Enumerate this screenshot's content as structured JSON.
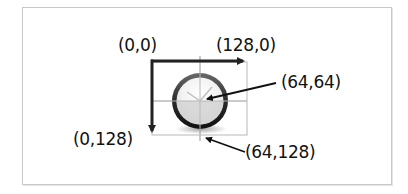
{
  "diagram": {
    "labels": {
      "origin": "(0,0)",
      "top_right": "(128,0)",
      "center": "(64,64)",
      "bottom_left": "(0,128)",
      "bottom_center": "(64,128)"
    },
    "icon": "clock-icon",
    "colors": {
      "frame_border": "#c8c8c8",
      "axis_arrow": "#222222",
      "grid_line": "#b8b8b8",
      "text": "#111111"
    }
  }
}
